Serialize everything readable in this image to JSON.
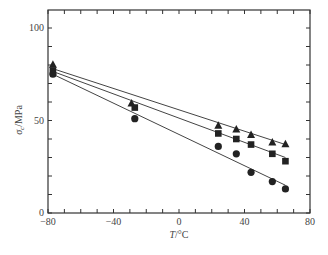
{
  "chart_data": {
    "type": "scatter",
    "title": "",
    "xlabel": "T/°C",
    "ylabel": "σc/MPa",
    "xlim": [
      -80,
      80
    ],
    "ylim": [
      0,
      110
    ],
    "x_ticks": [
      -80,
      -40,
      0,
      40,
      80
    ],
    "y_ticks": [
      0,
      50,
      100
    ],
    "grid": false,
    "legend": null,
    "series": [
      {
        "name": "triangle",
        "marker": "triangle",
        "x": [
          -77,
          -29,
          24,
          35,
          44,
          57,
          65
        ],
        "y": [
          80,
          59,
          47,
          45,
          42,
          38,
          37
        ],
        "fit_line": {
          "x": [
            -77,
            65
          ],
          "y": [
            78,
            37
          ]
        }
      },
      {
        "name": "square",
        "marker": "square",
        "x": [
          -77,
          -27,
          24,
          35,
          44,
          57,
          65
        ],
        "y": [
          77,
          57,
          43,
          40,
          37,
          32,
          28
        ],
        "fit_line": {
          "x": [
            -77,
            65
          ],
          "y": [
            76.5,
            30
          ]
        }
      },
      {
        "name": "circle",
        "marker": "circle",
        "x": [
          -77,
          -27,
          24,
          35,
          44,
          57,
          65
        ],
        "y": [
          75,
          51,
          36,
          32,
          22,
          17,
          13
        ],
        "fit_line": {
          "x": [
            -77,
            65
          ],
          "y": [
            75,
            15
          ]
        }
      }
    ]
  },
  "axes": {
    "x_title_main": "T",
    "x_title_unit": "/°C",
    "y_title_main": "σ",
    "y_title_sub": "c",
    "y_title_unit": "/MPa",
    "x_tick_labels": [
      "−80",
      "−40",
      "0",
      "40",
      "80"
    ],
    "y_tick_labels": [
      "0",
      "50",
      "100"
    ]
  }
}
